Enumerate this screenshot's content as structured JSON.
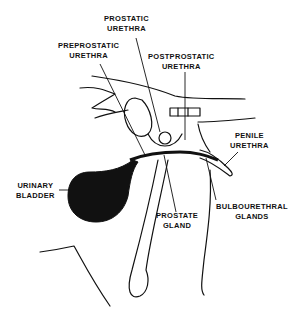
{
  "diagram": {
    "labels": {
      "prostatic_urethra": {
        "line1": "PROSTATIC",
        "line2": "URETHRA"
      },
      "preprostatic_urethra": {
        "line1": "PREPROSTATIC",
        "line2": "URETHRA"
      },
      "postprostatic_urethra": {
        "line1": "POSTPROSTATIC",
        "line2": "URETHRA"
      },
      "penile_urethra": {
        "line1": "PENILE",
        "line2": "URETHRA"
      },
      "urinary_bladder": {
        "line1": "URINARY",
        "line2": "BLADDER"
      },
      "prostate_gland": {
        "line1": "PROSTATE",
        "line2": "GLAND"
      },
      "bulbourethral_glands": {
        "line1": "BULBOURETHRAL",
        "line2": "GLANDS"
      }
    },
    "colors": {
      "ink": "#111111",
      "background": "#ffffff"
    }
  }
}
